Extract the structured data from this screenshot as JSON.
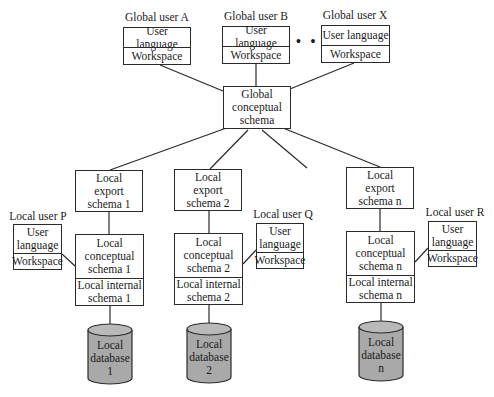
{
  "diagram": {
    "type": "federated-database-architecture",
    "global_users": [
      {
        "title": "Global user A",
        "rows": [
          "User language",
          "Workspace"
        ]
      },
      {
        "title": "Global user B",
        "rows": [
          "User language",
          "Workspace"
        ]
      },
      {
        "title": "Global user X",
        "rows": [
          "User language",
          "Workspace"
        ]
      }
    ],
    "ellipsis": "• • •",
    "global_schema": {
      "label": "Global conceptual schema",
      "lines": [
        "Global",
        "conceptual",
        "schema"
      ]
    },
    "sites": [
      {
        "export": [
          "Local",
          "export",
          "schema 1"
        ],
        "conceptual": [
          "Local",
          "conceptual",
          "schema 1"
        ],
        "internal": [
          "Local internal",
          "schema 1"
        ],
        "database": [
          "Local",
          "database",
          "1"
        ],
        "local_user": {
          "title": "Local user P",
          "rows": [
            [
              "User",
              "language"
            ],
            [
              "Workspace"
            ]
          ]
        }
      },
      {
        "export": [
          "Local",
          "export",
          "schema 2"
        ],
        "conceptual": [
          "Local",
          "conceptual",
          "schema 2"
        ],
        "internal": [
          "Local internal",
          "schema 2"
        ],
        "database": [
          "Local",
          "database",
          "2"
        ],
        "local_user": {
          "title": "Local user Q",
          "rows": [
            [
              "User",
              "language"
            ],
            [
              "Workspace"
            ]
          ]
        }
      },
      {
        "export": [
          "Local",
          "export",
          "schema n"
        ],
        "conceptual": [
          "Local",
          "conceptual",
          "schema n"
        ],
        "internal": [
          "Local internal",
          "schema n"
        ],
        "database": [
          "Local",
          "database",
          "n"
        ],
        "local_user": {
          "title": "Local user R",
          "rows": [
            [
              "User",
              "language"
            ],
            [
              "Workspace"
            ]
          ]
        }
      }
    ],
    "colors": {
      "line": "#2a2a2a",
      "database_fill": "#a9a9a9",
      "box_fill": "#ffffff"
    }
  }
}
